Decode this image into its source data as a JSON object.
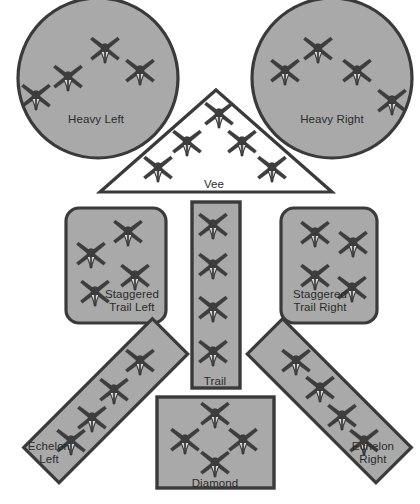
{
  "diagram": {
    "background_color": "#ffffff",
    "shape_fill": "#a9a9a9",
    "shape_stroke": "#3a3a3a",
    "open_shape_fill": "#ffffff",
    "label_color": "#2b2b2b",
    "aircraft_color": "#3d3d3d",
    "aircraft_icon": "fighter-jet-top-view-icon",
    "formations": [
      {
        "id": "heavy-left",
        "label": "Heavy Left",
        "shape": "circle",
        "filled": true,
        "aircraft_count": 4,
        "label_x": 96,
        "label_y": 113,
        "aircraft": [
          {
            "x": 36,
            "y": 95
          },
          {
            "x": 68,
            "y": 76
          },
          {
            "x": 105,
            "y": 48
          },
          {
            "x": 140,
            "y": 70
          }
        ]
      },
      {
        "id": "heavy-right",
        "label": "Heavy Right",
        "shape": "circle",
        "filled": true,
        "aircraft_count": 4,
        "label_x": 332,
        "label_y": 113,
        "aircraft": [
          {
            "x": 285,
            "y": 70
          },
          {
            "x": 318,
            "y": 48
          },
          {
            "x": 357,
            "y": 70
          },
          {
            "x": 392,
            "y": 100
          }
        ]
      },
      {
        "id": "vee",
        "label": "Vee",
        "shape": "triangle",
        "filled": false,
        "aircraft_count": 5,
        "label_x": 214,
        "label_y": 178,
        "aircraft": [
          {
            "x": 158,
            "y": 167
          },
          {
            "x": 187,
            "y": 141
          },
          {
            "x": 219,
            "y": 113
          },
          {
            "x": 242,
            "y": 141
          },
          {
            "x": 272,
            "y": 167
          }
        ]
      },
      {
        "id": "staggered-trail-left",
        "label": "Staggered\nTrail Left",
        "shape": "rounded-rect",
        "filled": true,
        "aircraft_count": 4,
        "label_x": 132,
        "label_y": 288,
        "aircraft": [
          {
            "x": 128,
            "y": 231
          },
          {
            "x": 91,
            "y": 253
          },
          {
            "x": 135,
            "y": 275
          },
          {
            "x": 95,
            "y": 291
          }
        ]
      },
      {
        "id": "trail",
        "label": "Trail",
        "shape": "rect",
        "filled": true,
        "aircraft_count": 4,
        "label_x": 215,
        "label_y": 375,
        "aircraft": [
          {
            "x": 213,
            "y": 224
          },
          {
            "x": 213,
            "y": 264
          },
          {
            "x": 213,
            "y": 307
          },
          {
            "x": 213,
            "y": 351
          }
        ]
      },
      {
        "id": "staggered-trail-right",
        "label": "Staggered\nTrail Right",
        "shape": "rounded-rect",
        "filled": true,
        "aircraft_count": 4,
        "label_x": 320,
        "label_y": 288,
        "aircraft": [
          {
            "x": 315,
            "y": 232
          },
          {
            "x": 353,
            "y": 242
          },
          {
            "x": 315,
            "y": 275
          },
          {
            "x": 352,
            "y": 287
          }
        ]
      },
      {
        "id": "echelon-left",
        "label": "Echelon\nLeft",
        "shape": "rotated-rect",
        "rotation": -45,
        "filled": true,
        "aircraft_count": 4,
        "label_x": 49,
        "label_y": 440,
        "aircraft": [
          {
            "x": 140,
            "y": 360
          },
          {
            "x": 114,
            "y": 389
          },
          {
            "x": 92,
            "y": 417
          },
          {
            "x": 71,
            "y": 440
          }
        ]
      },
      {
        "id": "diamond",
        "label": "Diamond",
        "shape": "rect",
        "filled": true,
        "aircraft_count": 4,
        "label_x": 215,
        "label_y": 477,
        "aircraft": [
          {
            "x": 215,
            "y": 413
          },
          {
            "x": 185,
            "y": 439
          },
          {
            "x": 243,
            "y": 439
          },
          {
            "x": 215,
            "y": 462
          }
        ]
      },
      {
        "id": "echelon-right",
        "label": "Echelon\nRight",
        "shape": "rotated-rect",
        "rotation": 45,
        "filled": true,
        "aircraft_count": 4,
        "label_x": 373,
        "label_y": 440,
        "aircraft": [
          {
            "x": 296,
            "y": 360
          },
          {
            "x": 320,
            "y": 387
          },
          {
            "x": 342,
            "y": 415
          },
          {
            "x": 364,
            "y": 440
          }
        ]
      }
    ]
  }
}
